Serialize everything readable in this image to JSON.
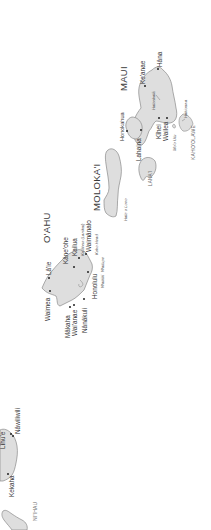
{
  "map": {
    "title": "Hawaiian Islands",
    "orientation_note": "rotated 90 degrees counter-clockwise",
    "colors": {
      "land": "#dedede",
      "coast": "#8a8a8a",
      "text": "#333333",
      "water": "#ffffff"
    },
    "islands": {
      "maui": "MAUI",
      "molokai": "MOLOKA'I",
      "lanai": "LANA'I",
      "kahoolawe": "KAHO'OLAWE",
      "oahu": "O'AHU",
      "niihau": "NI'IHAU"
    },
    "towns": {
      "hana": "Hāna",
      "keanae": "Ke'anae",
      "honokahua": "Honokahua",
      "lahaina": "Lahaina",
      "kihei": "Kīhei",
      "wailea": "Wailea",
      "laie": "Lā'ie",
      "kaneohe": "Kāne'ohe",
      "kailua": "Kailua",
      "waimanalo": "Waimānalo",
      "honolulu": "Honolulu",
      "waimea": "Waimea",
      "makaha": "Mākaha",
      "waianae": "Wai'anae",
      "nanakuli": "Nānākuli",
      "lihue": "Līhu'e",
      "nawiliwili": "Nāwiliwili",
      "kekaha": "Kekaha"
    },
    "features": {
      "haleakala": "Haleakalā",
      "hakioawa": "Hakioawa",
      "moo_ulu": "Mo'o Ulu",
      "hale_o_lono": "Hale o Lono",
      "kaohao": "Ka'ōhao (Lanikai)",
      "koko_head": "Koko Head",
      "waikiki": "Waikīkī",
      "wailupe": "Wailupe"
    }
  }
}
